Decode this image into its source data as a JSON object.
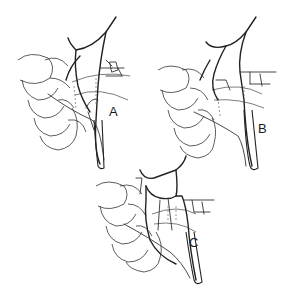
{
  "figure": {
    "type": "anatomical line drawing",
    "background": "#ffffff",
    "ink_color": "#222222"
  },
  "panels": [
    {
      "id": "A",
      "label": "A",
      "label_pos": [
        113,
        116
      ]
    },
    {
      "id": "B",
      "label": "B",
      "label_pos": [
        262,
        133
      ]
    },
    {
      "id": "C",
      "label": "C",
      "label_pos": [
        193,
        247
      ]
    }
  ]
}
